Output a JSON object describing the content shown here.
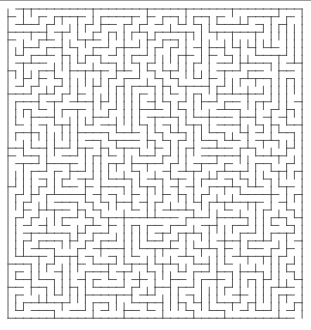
{
  "page": {
    "background": "#ffffff",
    "top_rule_color": "#9a9a9a"
  },
  "maze": {
    "cols": 38,
    "rows": 40,
    "left": 8,
    "top": 9,
    "cell_w": 7.74,
    "cell_h": 7.73,
    "wall_color": "#4a4a4a",
    "wall_width": 0.9,
    "seed": 7,
    "entrance_col": 0,
    "exit_col": 37
  }
}
